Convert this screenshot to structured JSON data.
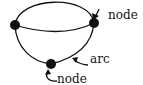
{
  "diagram": {
    "type": "graph",
    "nodes": [
      {
        "id": "left",
        "x": 15,
        "y": 25
      },
      {
        "id": "right",
        "x": 94,
        "y": 23
      },
      {
        "id": "bottom",
        "x": 51,
        "y": 64
      }
    ],
    "arcs": [
      {
        "from": "left",
        "to": "right",
        "shape": "top-curve"
      },
      {
        "from": "left",
        "to": "right",
        "shape": "middle-curve"
      },
      {
        "from": "left",
        "to": "bottom",
        "shape": "left-curve"
      },
      {
        "from": "right",
        "to": "bottom",
        "shape": "right-curve"
      }
    ],
    "labels": {
      "node_top": "node",
      "arc": "arc",
      "node_bottom": "node"
    },
    "colors": {
      "ink": "#111111",
      "background": "#ffffff"
    }
  }
}
